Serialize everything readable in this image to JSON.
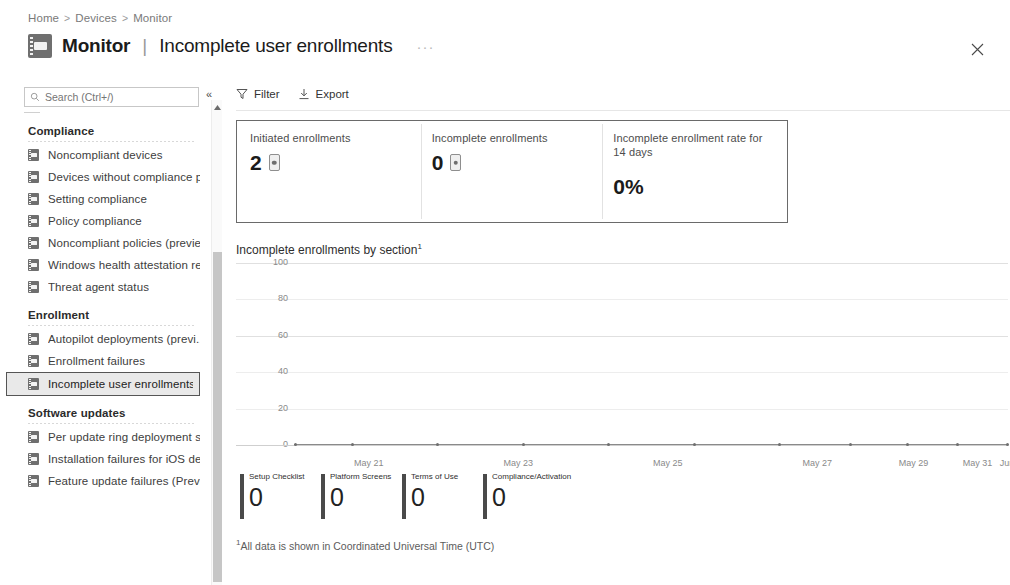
{
  "breadcrumb": {
    "items": [
      "Home",
      "Devices",
      "Monitor"
    ],
    "separator": ">"
  },
  "header": {
    "icon": "monitor-notebook-icon",
    "title": "Monitor",
    "pipe": "|",
    "subtitle": "Incomplete user enrollments",
    "ellipsis": "···",
    "close_icon": "close-icon"
  },
  "search": {
    "placeholder": "Search (Ctrl+/)",
    "value": "",
    "icon": "search-icon"
  },
  "collapse": {
    "icon": "chevron-double-left-icon",
    "glyph": "«"
  },
  "scrollbar": {
    "up_arrow": "▲"
  },
  "sidebar": {
    "groups": [
      {
        "title": "Compliance",
        "items": [
          {
            "label": "Noncompliant devices",
            "selected": false
          },
          {
            "label": "Devices without compliance p...",
            "selected": false
          },
          {
            "label": "Setting compliance",
            "selected": false
          },
          {
            "label": "Policy compliance",
            "selected": false
          },
          {
            "label": "Noncompliant policies (previe...",
            "selected": false
          },
          {
            "label": "Windows health attestation re...",
            "selected": false
          },
          {
            "label": "Threat agent status",
            "selected": false
          }
        ]
      },
      {
        "title": "Enrollment",
        "items": [
          {
            "label": "Autopilot deployments (previ...",
            "selected": false
          },
          {
            "label": "Enrollment failures",
            "selected": false
          },
          {
            "label": "Incomplete user enrollments",
            "selected": true
          }
        ]
      },
      {
        "title": "Software updates",
        "items": [
          {
            "label": "Per update ring deployment s...",
            "selected": false
          },
          {
            "label": "Installation failures for iOS de...",
            "selected": false
          },
          {
            "label": "Feature update failures (Previ...",
            "selected": false
          }
        ]
      }
    ]
  },
  "toolbar": {
    "filter_label": "Filter",
    "filter_icon": "funnel-icon",
    "export_label": "Export",
    "export_icon": "download-icon"
  },
  "kpis": [
    {
      "title": "Initiated enrollments",
      "value": "2",
      "icon": "device-icon",
      "has_icon": true
    },
    {
      "title": "Incomplete enrollments",
      "value": "0",
      "icon": "device-icon",
      "has_icon": true
    },
    {
      "title": "Incomplete enrollment rate for 14 days",
      "value": "0%",
      "icon": "",
      "has_icon": false
    }
  ],
  "footnote": {
    "marker": "1",
    "text": "All data is shown in Coordinated Universal Time (UTC)"
  },
  "chart_data": {
    "type": "line",
    "title": "Incomplete enrollments by section",
    "title_superscript": "1",
    "xlabel": "",
    "ylabel": "",
    "ylim": [
      0,
      100
    ],
    "yticks": [
      100,
      80,
      60,
      40,
      20,
      0
    ],
    "grid": true,
    "legend_position": "bottom",
    "x": [
      "May 21",
      "May 23",
      "May 25",
      "May 27",
      "May 29",
      "May 31",
      "June"
    ],
    "xtick_positions_pct": [
      10.5,
      31.5,
      52.5,
      73.5,
      87.0,
      96.0,
      100.5
    ],
    "series": [
      {
        "name": "Setup Checklist",
        "value": "0",
        "color": "#4a4a4a",
        "values": [
          0,
          0,
          0,
          0,
          0,
          0,
          0
        ]
      },
      {
        "name": "Platform Screens",
        "value": "0",
        "color": "#4a4a4a",
        "values": [
          0,
          0,
          0,
          0,
          0,
          0,
          0
        ]
      },
      {
        "name": "Terms of Use",
        "value": "0",
        "color": "#4a4a4a",
        "values": [
          0,
          0,
          0,
          0,
          0,
          0,
          0
        ]
      },
      {
        "name": "Compliance/Activation",
        "value": "0",
        "color": "#4a4a4a",
        "values": [
          0,
          0,
          0,
          0,
          0,
          0,
          0
        ]
      }
    ],
    "marker_positions_pct": [
      0,
      8,
      20,
      32,
      44,
      56,
      68,
      78,
      86,
      93,
      100
    ]
  },
  "colors": {
    "border_emphasis": "#6a6a6a",
    "grid": "#ededed",
    "text": "#333333"
  }
}
